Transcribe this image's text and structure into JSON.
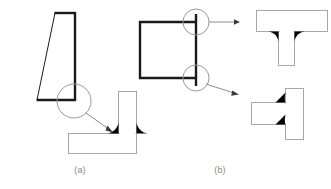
{
  "figure": {
    "background_color": "#ffffff",
    "width": 331,
    "height": 189,
    "captions": [
      {
        "id": "a",
        "label": "(a)",
        "x": 80,
        "y": 170
      },
      {
        "id": "b",
        "label": "(b)",
        "x": 220,
        "y": 170
      }
    ],
    "colors": {
      "part_outline_dark": "#1a1a1a",
      "part_outline_light": "#a8a8a8",
      "detail_circle": "#9a9a9a",
      "leader_line": "#8c8c8c",
      "weld_fill": "#000000",
      "caption_text": "#8a8a8a"
    }
  },
  "panel_a": {
    "name": "panel-a",
    "label": "(a)",
    "assembly_view": {
      "name": "trapezoid-section",
      "description": "Trapezoidal plate cross-section with thick right, top and bottom edges and a thin slanted left edge",
      "outline_points": "37,100 55,13 75,13 75,100",
      "thick_edges": [
        {
          "name": "top-edge",
          "x1": 55,
          "y1": 13,
          "x2": 75,
          "y2": 13
        },
        {
          "name": "right-edge",
          "x1": 75,
          "y1": 13,
          "x2": 75,
          "y2": 100
        },
        {
          "name": "bottom-edge",
          "x1": 37,
          "y1": 100,
          "x2": 75,
          "y2": 100
        }
      ],
      "thin_edges": [
        {
          "name": "left-slant-edge",
          "x1": 37,
          "y1": 100,
          "x2": 55,
          "y2": 13
        }
      ]
    },
    "detail_circle": {
      "name": "detail-circle-a",
      "cx": 74,
      "cy": 101,
      "r": 17
    },
    "leader": {
      "name": "leader-arrow-a",
      "x1": 86,
      "y1": 113,
      "x2": 112,
      "y2": 132,
      "arrow_angle_deg": 36
    },
    "detail_view": {
      "name": "tee-joint-detail-a",
      "description": "Vertical plate standing on horizontal base plate with two black fillet welds at the root",
      "vertical_plate": {
        "x": 118,
        "y": 91,
        "width": 19,
        "height": 47
      },
      "horizontal_plate": {
        "x": 68,
        "y": 133,
        "width": 69,
        "height": 21
      },
      "fillets": [
        {
          "name": "fillet-weld-left",
          "side": "left",
          "leg": 11
        },
        {
          "name": "fillet-weld-right",
          "side": "right",
          "leg": 11
        }
      ]
    }
  },
  "panel_b": {
    "name": "panel-b",
    "label": "(b)",
    "assembly_view": {
      "name": "box-section",
      "description": "Square box cross-section; thick top, left and bottom members plus a vertical member at the right that over-runs at both ends",
      "thick_edges": [
        {
          "name": "top-edge",
          "x1": 139,
          "y1": 22,
          "x2": 196,
          "y2": 22
        },
        {
          "name": "left-edge",
          "x1": 140,
          "y1": 22,
          "x2": 140,
          "y2": 78
        },
        {
          "name": "bottom-edge",
          "x1": 139,
          "y1": 78,
          "x2": 196,
          "y2": 78
        },
        {
          "name": "right-vertical-member",
          "x1": 196,
          "y1": 14,
          "x2": 196,
          "y2": 86
        }
      ]
    },
    "detail_circles": [
      {
        "name": "detail-circle-b-top",
        "cx": 196,
        "cy": 22,
        "r": 13
      },
      {
        "name": "detail-circle-b-bottom",
        "cx": 196,
        "cy": 78,
        "r": 13
      }
    ],
    "leaders": [
      {
        "name": "leader-arrow-b-top",
        "x1": 209,
        "y1": 22,
        "x2": 238,
        "y2": 22,
        "style": "horizontal"
      },
      {
        "name": "leader-arrow-b-bottom",
        "x1": 207,
        "y1": 84,
        "x2": 237,
        "y2": 94,
        "style": "diagonal"
      }
    ],
    "detail_view_top": {
      "name": "inverted-tee-joint-detail-b",
      "description": "Horizontal plate above with vertical plate hanging beneath, two black fillet welds under the flange",
      "horizontal_plate": {
        "x": 256,
        "y": 10,
        "width": 72,
        "height": 22
      },
      "vertical_plate": {
        "x": 278,
        "y": 32,
        "width": 17,
        "height": 34
      },
      "fillets": [
        {
          "name": "fillet-weld-left",
          "side": "left",
          "leg": 10
        },
        {
          "name": "fillet-weld-right",
          "side": "right",
          "leg": 10
        }
      ]
    },
    "detail_view_bottom": {
      "name": "rotated-tee-joint-detail-b",
      "description": "Vertical plate at the right with horizontal plate butting into it from the left, two black fillet welds at the junction",
      "vertical_plate": {
        "x": 285,
        "y": 88,
        "width": 19,
        "height": 52
      },
      "horizontal_plate": {
        "x": 251,
        "y": 102,
        "width": 34,
        "height": 23
      },
      "fillets": [
        {
          "name": "fillet-weld-upper",
          "side": "upper",
          "leg": 10
        },
        {
          "name": "fillet-weld-lower",
          "side": "lower",
          "leg": 10
        }
      ]
    }
  }
}
